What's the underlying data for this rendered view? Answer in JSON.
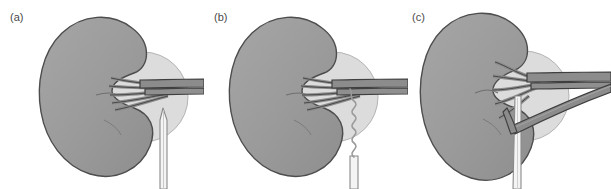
{
  "figure": {
    "background_color": "#ffffff",
    "width": 611,
    "height": 189,
    "panel_count": 3
  },
  "palette": {
    "kidney_fill": "#9a9a9a",
    "kidney_outline": "#4d4d4d",
    "kidney_highlight": "#a8a8a8",
    "halo_fill": "#dcdcdc",
    "halo_outline": "#b0b0b0",
    "vessel_fill": "#8c8c8c",
    "vessel_outline": "#3f3f3f",
    "catheter_fill": "#f4f4f4",
    "catheter_outline": "#8a8a8a",
    "label_color": "#4a4a4a"
  },
  "panels": [
    {
      "id": "panel-a",
      "label": "(a)",
      "device": "straight-needle",
      "device_description": "Straight rigid needle positioned below the renal hilum, tip directed upward toward the vessels",
      "organs": [
        "kidney",
        "renal-hilum-halo",
        "renal-artery",
        "renal-vein",
        "segmental-branches"
      ],
      "branch_count": 5
    },
    {
      "id": "panel-b",
      "label": "(b)",
      "device": "coiled-guidewire",
      "device_description": "Helical coiled guidewire advanced out of the straight sheath toward the renal hilum",
      "organs": [
        "kidney",
        "renal-hilum-halo",
        "renal-artery",
        "renal-vein",
        "segmental-branches"
      ],
      "branch_count": 5
    },
    {
      "id": "panel-c",
      "label": "(c)",
      "device": "cannulating-catheter",
      "device_description": "Catheter advanced vertically with an additional vessel limb coursing diagonally down and to the right over the catheter shaft",
      "organs": [
        "kidney",
        "renal-hilum-halo",
        "renal-artery",
        "renal-vein",
        "segmental-branches",
        "diagonal-vessel-limb"
      ],
      "branch_count": 5
    }
  ]
}
